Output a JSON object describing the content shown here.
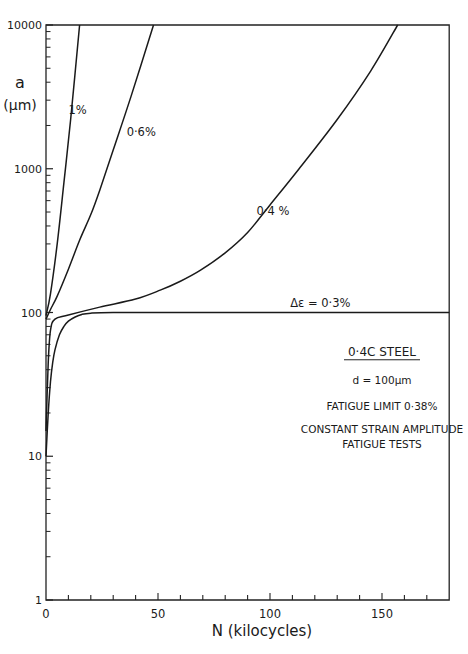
{
  "chart_data": {
    "type": "line",
    "title": "",
    "xlabel": "N (kilocycles)",
    "ylabel": "a (μm)",
    "ylabel_line1": "a",
    "ylabel_line2": "(μm)",
    "xlim": [
      0,
      180
    ],
    "ylim": [
      1,
      10000
    ],
    "yscale": "log",
    "grid": false,
    "x_ticks": [
      0,
      50,
      100,
      150
    ],
    "x_minor_step": 10,
    "y_ticks": [
      1,
      10,
      100,
      1000,
      10000
    ],
    "y_tick_labels": [
      "1",
      "10",
      "100",
      "1000",
      "10000"
    ],
    "series": [
      {
        "name": "1%",
        "label": "1%",
        "label_pos": [
          10,
          2400
        ],
        "x": [
          0,
          2,
          5,
          8,
          11,
          15
        ],
        "y": [
          95,
          135,
          300,
          800,
          2200,
          10000
        ]
      },
      {
        "name": "0.6%",
        "label": "0·6%",
        "label_pos": [
          36,
          1700
        ],
        "x": [
          0,
          2,
          5,
          10,
          15,
          20,
          24,
          30,
          38,
          48
        ],
        "y": [
          90,
          105,
          130,
          200,
          318,
          480,
          710,
          1350,
          3200,
          10000
        ]
      },
      {
        "name": "0.4%",
        "label": "0·4 %",
        "label_pos": [
          94,
          480
        ],
        "x": [
          0,
          1,
          2,
          4,
          10,
          24,
          40,
          51,
          60,
          69,
          80,
          90,
          100,
          113,
          130,
          145,
          157
        ],
        "y": [
          15,
          45,
          75,
          90,
          96,
          109,
          124,
          143,
          165,
          197,
          260,
          360,
          560,
          1000,
          2200,
          4800,
          10000
        ]
      },
      {
        "name": "Δε = 0.3%",
        "label": "Δε  = 0·3%",
        "label_pos": [
          109,
          110
        ],
        "x": [
          0,
          1,
          2,
          3,
          4,
          6,
          8,
          10,
          13,
          16,
          20,
          30,
          60,
          100,
          150,
          180
        ],
        "y": [
          10,
          20,
          33,
          45,
          55,
          70,
          80,
          87,
          93,
          97,
          99,
          100,
          100,
          100,
          100,
          100
        ]
      }
    ],
    "annotations": [
      {
        "text": "0·4C  STEEL",
        "underline": true,
        "pos": [
          125,
          50
        ]
      },
      {
        "text": "d = 100μm",
        "pos": [
          125,
          32
        ]
      },
      {
        "text": "FATIGUE LIMIT 0·38%",
        "pos": [
          125,
          21
        ]
      },
      {
        "text": "CONSTANT STRAIN AMPLITUDE",
        "pos": [
          125,
          14.5
        ]
      },
      {
        "text": "FATIGUE TESTS",
        "pos": [
          125,
          11.5
        ]
      }
    ]
  }
}
